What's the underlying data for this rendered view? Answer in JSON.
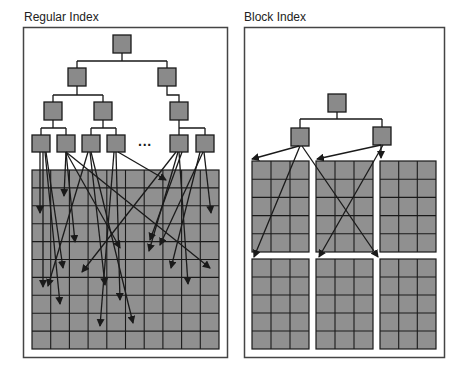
{
  "panels": [
    {
      "title": "Regular Index",
      "ellipsis": "...",
      "grid": {
        "rows": 10,
        "cols": 10
      }
    },
    {
      "title": "Block Index",
      "blocks": {
        "rows": 2,
        "cols": 3,
        "cell_rows": 5,
        "cell_cols": 3
      }
    }
  ],
  "colors": {
    "node_fill": "#8a8a8a",
    "grid_fill": "#909090",
    "line": "#1a1a1a",
    "panel_border": "#444444"
  }
}
